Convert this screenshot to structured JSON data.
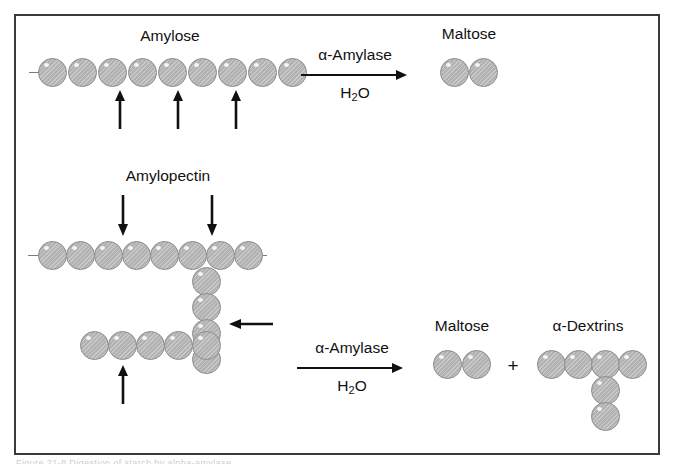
{
  "figure": {
    "caption_sliver": "Figure 21-8  Digestion of starch by alpha-amylase"
  },
  "labels": {
    "amylose": "Amylose",
    "amylopectin": "Amylopectin",
    "maltose_top": "Maltose",
    "maltose_bottom": "Maltose",
    "alpha_dextrins": "α-Dextrins",
    "plus": "+"
  },
  "reactions": [
    {
      "id": "amylose-reaction",
      "enzyme": "α-Amylase",
      "cosubstrate_text": "H",
      "cosubstrate_sub": "2",
      "cosubstrate_tail": "O",
      "cosubstrate": "H2O"
    },
    {
      "id": "amylopectin-reaction",
      "enzyme": "α-Amylase",
      "cosubstrate_text": "H",
      "cosubstrate_sub": "2",
      "cosubstrate_tail": "O",
      "cosubstrate": "H2O"
    }
  ],
  "structures": {
    "amylose": {
      "name": "Amylose",
      "description": "Unbranched linear chain of glucose units",
      "unit_count": 9,
      "cleavage_arrows": 3,
      "cleavage_arrow_direction": "up"
    },
    "amylopectin": {
      "name": "Amylopectin",
      "description": "Branched chain of glucose units",
      "main_chain_units": 8,
      "branch_vertical_units": 4,
      "side_chain_units": 5,
      "arrows": [
        {
          "direction": "down",
          "target": "main-chain"
        },
        {
          "direction": "down",
          "target": "main-chain"
        },
        {
          "direction": "left",
          "target": "branch-point"
        },
        {
          "direction": "up",
          "target": "side-chain"
        }
      ]
    },
    "maltose": {
      "name": "Maltose",
      "description": "Disaccharide of two glucose units",
      "unit_count": 2
    },
    "alpha_dextrins": {
      "name": "α-Dextrins",
      "description": "Branched oligosaccharide fragment",
      "top_row_units": 4,
      "branch_units": 2
    }
  },
  "colors": {
    "unit_fill": "#b2b2b2",
    "unit_stroke": "#8d8d8d",
    "arrow": "#111111",
    "frame": "#3a3a3a",
    "text": "#111111",
    "background": "#ffffff"
  }
}
